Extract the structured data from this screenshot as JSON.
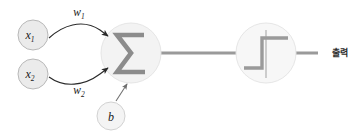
{
  "diagram": {
    "background_color": "#ffffff",
    "nodes": {
      "input1": {
        "label_base": "x",
        "label_sub": "1",
        "full_label": "x₁",
        "cx": 33,
        "cy": 35,
        "r": 15,
        "fill": "#ebebeb",
        "stroke": "#b8b8b8"
      },
      "input2": {
        "label_base": "x",
        "label_sub": "2",
        "full_label": "x₂",
        "cx": 33,
        "cy": 74,
        "r": 15,
        "fill": "#ebebeb",
        "stroke": "#b8b8b8"
      },
      "bias": {
        "label_base": "b",
        "label_sub": "",
        "full_label": "b",
        "cx": 111,
        "cy": 116,
        "r": 14,
        "fill": "#f2f2f2",
        "stroke": "#cfcfcf"
      },
      "summation": {
        "symbol": "Σ",
        "cx": 131,
        "cy": 53,
        "r": 30,
        "fill": "#f3f3f3",
        "stroke": "#e2e2e2"
      },
      "activation": {
        "symbol": "step-function",
        "cx": 266,
        "cy": 53,
        "r": 30,
        "fill": "#f7f7f7",
        "stroke": "#e2e2e2"
      }
    },
    "edges": {
      "weight1": {
        "label_base": "w",
        "label_sub": "1",
        "full_label": "w₁",
        "label_x": 79,
        "label_y": 16
      },
      "weight2": {
        "label_base": "w",
        "label_sub": "2",
        "full_label": "w₂",
        "label_x": 79,
        "label_y": 94
      },
      "bias_edge": {
        "label": ""
      }
    },
    "output": {
      "label": "출력",
      "label_x": 332,
      "label_y": 56
    },
    "colors": {
      "arrow_stroke": "#2a2a2a",
      "trunk_line": "#9a9a9a",
      "sigma_glyph": "#8c8c8c",
      "step_glyph": "#9a9a9a",
      "node_text": "#1a1a1a"
    }
  }
}
